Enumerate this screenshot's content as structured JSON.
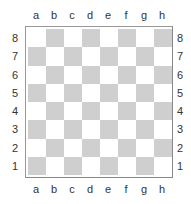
{
  "board": {
    "files": [
      "a",
      "b",
      "c",
      "d",
      "e",
      "f",
      "g",
      "h"
    ],
    "ranks": [
      "8",
      "7",
      "6",
      "5",
      "4",
      "3",
      "2",
      "1"
    ],
    "colors": {
      "light": "#ffffff",
      "dark": "#cfcfcf",
      "border": "#999999",
      "label": "#333333"
    },
    "pieces": []
  }
}
